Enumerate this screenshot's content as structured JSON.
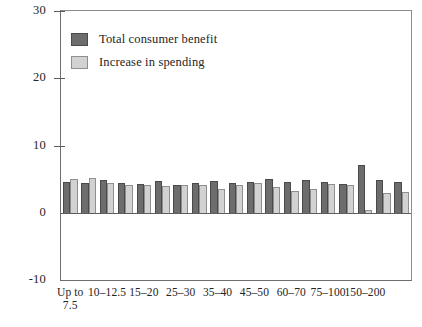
{
  "chart_data": {
    "type": "bar",
    "title": "",
    "subtitle": "",
    "xlabel": "",
    "ylabel": "",
    "ylim": [
      -10,
      30
    ],
    "y_ticks": [
      -10,
      0,
      10,
      20,
      30
    ],
    "y_tick_labels": [
      "-10",
      "0",
      "10",
      "20",
      "30"
    ],
    "grid": false,
    "legend_position": "upper-left-inside",
    "categories": [
      "Up to 7.5",
      "7.5-10",
      "10-12.5",
      "12.5-15",
      "15-20",
      "20-25",
      "25-30",
      "30-35",
      "35-40",
      "40-45",
      "45-50",
      "50-60",
      "60-70",
      "70-75",
      "75-100",
      "100-150",
      "150-200",
      "200-300",
      "300+"
    ],
    "visible_x_tick_labels": [
      {
        "index": 0,
        "line1": "Up to",
        "line2": "7.5"
      },
      {
        "index": 2,
        "line1": "10–12.5",
        "line2": ""
      },
      {
        "index": 4,
        "line1": "15–20",
        "line2": ""
      },
      {
        "index": 6,
        "line1": "25–30",
        "line2": ""
      },
      {
        "index": 8,
        "line1": "35–40",
        "line2": ""
      },
      {
        "index": 10,
        "line1": "45–50",
        "line2": ""
      },
      {
        "index": 12,
        "line1": "60–70",
        "line2": ""
      },
      {
        "index": 14,
        "line1": "75–100",
        "line2": ""
      },
      {
        "index": 16,
        "line1": "150–200",
        "line2": ""
      }
    ],
    "series": [
      {
        "name": "Total consumer benefit",
        "color": "#6d6d6d",
        "values": [
          4.6,
          4.4,
          4.8,
          4.5,
          4.3,
          4.7,
          4.1,
          4.4,
          4.7,
          4.4,
          4.6,
          5.0,
          4.6,
          4.8,
          4.6,
          4.3,
          7.1,
          4.8,
          4.6
        ]
      },
      {
        "name": "Increase in spending",
        "color": "#d2d2d2",
        "values": [
          5.0,
          5.1,
          4.5,
          4.2,
          4.1,
          4.0,
          4.2,
          4.1,
          3.6,
          4.2,
          4.4,
          3.9,
          3.3,
          3.5,
          4.3,
          4.1,
          0.4,
          3.0,
          3.1
        ]
      }
    ]
  },
  "legend": {
    "items": [
      {
        "label": "Total consumer benefit",
        "swatch": "dark"
      },
      {
        "label": "Increase in spending",
        "swatch": "light"
      }
    ]
  }
}
